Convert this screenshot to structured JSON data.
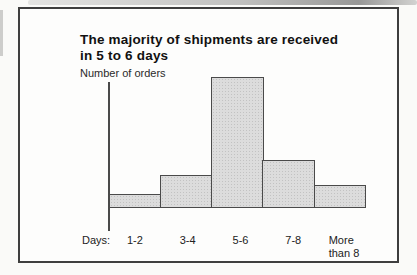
{
  "figure": {
    "title_line1": "The majority of shipments are received",
    "title_line2": "in 5 to 6 days",
    "y_axis_label": "Number of orders",
    "x_axis_prefix": "Days:"
  },
  "chart_data": {
    "type": "bar",
    "title": "The majority of shipments are received in 5 to 6 days",
    "xlabel": "Days:",
    "ylabel": "Number of orders",
    "categories": [
      "1-2",
      "3-4",
      "5-6",
      "7-8",
      "More than 8"
    ],
    "display_labels": [
      "1-2",
      "3-4",
      "5-6",
      "7-8",
      "More\nthan 8"
    ],
    "values": [
      10.7,
      25.2,
      100,
      36.6,
      17.6
    ],
    "values_unit": "relative bar height, % of tallest bar (no numeric y-axis shown)",
    "ylim": [
      0,
      100
    ],
    "grid": false,
    "legend": false,
    "bar_fill": "#dcdcdc",
    "bar_border": "#4a4a4a"
  },
  "colors": {
    "frame_border": "#3e3e3e",
    "background": "#fafaf8",
    "text": "#1b1b1b"
  }
}
